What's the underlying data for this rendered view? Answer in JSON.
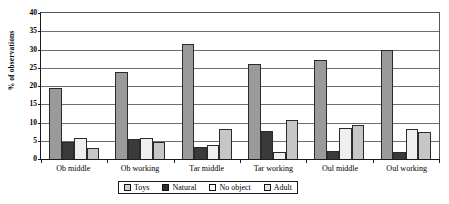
{
  "chart_data": {
    "type": "bar",
    "title": "",
    "xlabel": "",
    "ylabel": "% of observations",
    "ylim": [
      0,
      40
    ],
    "ytick_step": 5,
    "yticks": [
      "40",
      "35",
      "30",
      "25",
      "20",
      "15",
      "10",
      "5",
      "0"
    ],
    "grid": true,
    "legend_position": "bottom",
    "categories": [
      "Ob middle",
      "Ob working",
      "Tar middle",
      "Tar working",
      "Oul middle",
      "Oul working"
    ],
    "series": [
      {
        "name": "Toys",
        "color": "#9a9a9a",
        "values": [
          19.2,
          23.5,
          31.0,
          25.6,
          26.8,
          29.5
        ]
      },
      {
        "name": "Natural",
        "color": "#3a3a3a",
        "values": [
          4.7,
          5.3,
          3.3,
          7.7,
          2.2,
          2.0
        ]
      },
      {
        "name": "No object",
        "color": "#efefef",
        "values": [
          5.8,
          5.8,
          3.7,
          1.8,
          8.3,
          8.0
        ]
      },
      {
        "name": "Adult",
        "color": "#c6c6c6",
        "values": [
          2.9,
          4.5,
          8.0,
          10.5,
          9.3,
          7.3
        ]
      }
    ]
  }
}
